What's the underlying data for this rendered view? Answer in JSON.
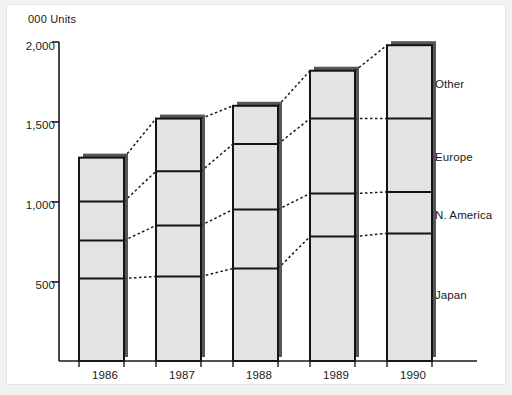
{
  "chart_data": {
    "type": "bar",
    "subtype": "stacked-bar",
    "title": "",
    "ylabel": "000 Units",
    "xlabel": "",
    "categories": [
      "1986",
      "1987",
      "1988",
      "1989",
      "1990"
    ],
    "series": [
      {
        "name": "Japan",
        "values": [
          518,
          530,
          580,
          780,
          800
        ]
      },
      {
        "name": "N. America",
        "values": [
          237,
          320,
          370,
          270,
          260
        ]
      },
      {
        "name": "Europe",
        "values": [
          245,
          340,
          410,
          470,
          460
        ]
      },
      {
        "name": "Other",
        "values": [
          275,
          330,
          240,
          300,
          460
        ]
      }
    ],
    "cumulative_tops": [
      {
        "category": "1986",
        "Japan": 518,
        "N. America": 755,
        "Europe": 1000,
        "Other": 1275,
        "total": 1275
      },
      {
        "category": "1987",
        "Japan": 530,
        "N. America": 850,
        "Europe": 1190,
        "Other": 1520,
        "total": 1520
      },
      {
        "category": "1988",
        "Japan": 580,
        "N. America": 950,
        "Europe": 1360,
        "Other": 1600,
        "total": 1600
      },
      {
        "category": "1989",
        "Japan": 780,
        "N. America": 1050,
        "Europe": 1520,
        "Other": 1820,
        "total": 1820
      },
      {
        "category": "1990",
        "Japan": 800,
        "N. America": 1060,
        "Europe": 1520,
        "Other": 1980,
        "total": 1980
      }
    ],
    "ylim": [
      0,
      2000
    ],
    "yticks": [
      500,
      1000,
      1500,
      2000
    ],
    "ytick_labels": [
      "500",
      "1,000",
      "1,500",
      "2,000"
    ],
    "grid": false,
    "legend_position": "right-inline",
    "legend_entries": [
      "Other",
      "Europe",
      "N. America",
      "Japan"
    ],
    "connector_lines": "dotted",
    "bar_fill": "#e3e3e3",
    "bar_edge": "#141414",
    "bar_shadow": "#3a3a3a",
    "axis_color": "#1a1a1a",
    "background": "#ffffff"
  },
  "axis": {
    "y_title": "000 Units",
    "y_ticks": [
      {
        "label": "2,000",
        "value": 2000
      },
      {
        "label": "1,500",
        "value": 1500
      },
      {
        "label": "1,000",
        "value": 1000
      },
      {
        "label": "500",
        "value": 500
      }
    ],
    "x_ticks": [
      {
        "label": "1986"
      },
      {
        "label": "1987"
      },
      {
        "label": "1988"
      },
      {
        "label": "1989"
      },
      {
        "label": "1990"
      }
    ]
  },
  "legend": {
    "items": [
      {
        "label": "Other"
      },
      {
        "label": "Europe"
      },
      {
        "label": "N. America"
      },
      {
        "label": "Japan"
      }
    ]
  }
}
